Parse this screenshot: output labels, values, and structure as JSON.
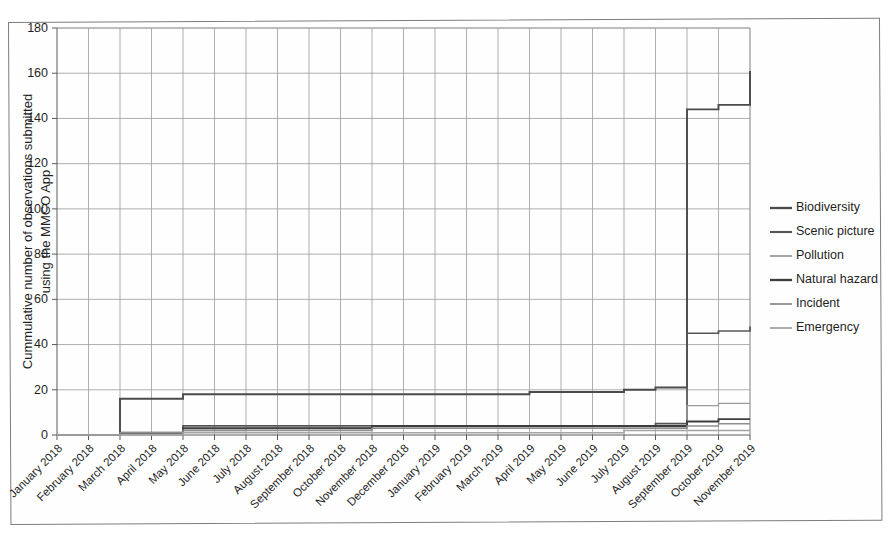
{
  "chart_data": {
    "type": "line",
    "title": "",
    "xlabel": "",
    "ylabel": "Cummulative number of observations submitted using the MMCO App",
    "ylabel_line1": "Cummulative number of observations submitted",
    "ylabel_line2": "using the MMCO App",
    "ylim": [
      0,
      180
    ],
    "ytick_step": 20,
    "yticks": [
      0,
      20,
      40,
      60,
      80,
      100,
      120,
      140,
      160,
      180
    ],
    "grid": true,
    "grid_axes": "both",
    "legend_position": "right",
    "categories": [
      "January 2018",
      "February 2018",
      "March 2018",
      "April 2018",
      "May 2018",
      "June 2018",
      "July 2018",
      "August 2018",
      "September 2018",
      "October 2018",
      "November 2018",
      "December 2018",
      "January 2019",
      "February 2019",
      "March 2019",
      "April 2019",
      "May 2019",
      "June 2019",
      "July 2019",
      "August 2019",
      "September 2019",
      "October 2019",
      "November 2019"
    ],
    "series": [
      {
        "name": "Biodiversity",
        "color": "#4a4a4a",
        "width": 1.9,
        "values": [
          0,
          0,
          16,
          16,
          18,
          18,
          18,
          18,
          18,
          18,
          18,
          18,
          18,
          18,
          18,
          19,
          19,
          19,
          20,
          21,
          144,
          146,
          161
        ]
      },
      {
        "name": "Scenic picture",
        "color": "#555555",
        "width": 1.7,
        "values": [
          0,
          0,
          1,
          1,
          4,
          4,
          4,
          4,
          4,
          4,
          4,
          4,
          4,
          4,
          4,
          4,
          4,
          4,
          4,
          5,
          45,
          46,
          48
        ]
      },
      {
        "name": "Pollution",
        "color": "#9b9b9b",
        "width": 1.4,
        "values": [
          0,
          0,
          1,
          1,
          2,
          2,
          3,
          3,
          3,
          3,
          3,
          3,
          3,
          3,
          3,
          3,
          3,
          3,
          3,
          3,
          13,
          14,
          14
        ]
      },
      {
        "name": "Natural hazard",
        "color": "#3d3d3d",
        "width": 1.9,
        "values": [
          0,
          0,
          1,
          1,
          3,
          3,
          3,
          3,
          3,
          3,
          4,
          4,
          4,
          4,
          4,
          4,
          4,
          4,
          4,
          4,
          6,
          7,
          7
        ]
      },
      {
        "name": "Incident",
        "color": "#8e8e8e",
        "width": 1.4,
        "values": [
          0,
          0,
          1,
          1,
          2,
          2,
          2,
          2,
          2,
          2,
          3,
          3,
          3,
          3,
          3,
          3,
          3,
          3,
          3,
          3,
          4,
          5,
          5
        ]
      },
      {
        "name": "Emergency",
        "color": "#a5a5a5",
        "width": 1.4,
        "values": [
          0,
          0,
          0,
          0,
          1,
          1,
          1,
          1,
          1,
          1,
          1,
          1,
          1,
          1,
          1,
          1,
          1,
          1,
          2,
          2,
          2,
          2,
          2
        ]
      }
    ],
    "annotations": []
  },
  "legend": {
    "items": [
      {
        "label": "Biodiversity"
      },
      {
        "label": "Scenic picture"
      },
      {
        "label": "Pollution"
      },
      {
        "label": "Natural hazard"
      },
      {
        "label": "Incident"
      },
      {
        "label": "Emergency"
      }
    ]
  }
}
